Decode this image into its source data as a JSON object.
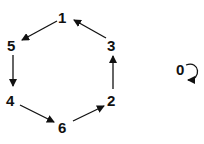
{
  "diagram": {
    "type": "directed-graph",
    "nodes": [
      {
        "id": "1",
        "label": "1",
        "x": 63,
        "y": 17
      },
      {
        "id": "3",
        "label": "3",
        "x": 112,
        "y": 45
      },
      {
        "id": "2",
        "label": "2",
        "x": 112,
        "y": 100
      },
      {
        "id": "6",
        "label": "6",
        "x": 63,
        "y": 127
      },
      {
        "id": "4",
        "label": "4",
        "x": 12,
        "y": 100
      },
      {
        "id": "5",
        "label": "5",
        "x": 13,
        "y": 45
      },
      {
        "id": "0",
        "label": "0",
        "x": 181,
        "y": 69
      }
    ],
    "edges": [
      {
        "from": "1",
        "to": "5"
      },
      {
        "from": "5",
        "to": "4"
      },
      {
        "from": "4",
        "to": "6"
      },
      {
        "from": "6",
        "to": "2"
      },
      {
        "from": "2",
        "to": "3"
      },
      {
        "from": "3",
        "to": "1"
      },
      {
        "from": "0",
        "to": "0",
        "self_loop": true
      }
    ],
    "color": "#111111"
  }
}
